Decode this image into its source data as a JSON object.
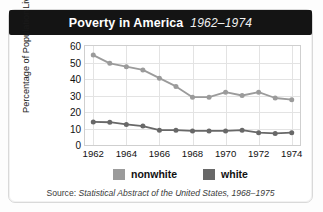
{
  "title": {
    "main": "Poverty in America",
    "years": "1962–1974"
  },
  "axes": {
    "ylabel_line1": "Percentage of Population",
    "ylabel_line2": "Living Below Poverty Level",
    "yticks": [
      "0",
      "10",
      "20",
      "30",
      "40",
      "50",
      "60"
    ],
    "xticks": [
      "1962",
      "1964",
      "1966",
      "1968",
      "1970",
      "1972",
      "1974"
    ]
  },
  "legend": {
    "items": [
      {
        "label": "nonwhite",
        "color": "#9b9b9b"
      },
      {
        "label": "white",
        "color": "#686868"
      }
    ]
  },
  "source": {
    "lead": "Source:",
    "cite": "Statistical Abstract of the United States, 1968–1975"
  },
  "colors": {
    "title_bar": "#141414",
    "title_text": "#ffffff",
    "grid": "#e3e3e3",
    "plot_border": "#cfcfcf",
    "nonwhite": "#9b9b9b",
    "white": "#686868"
  },
  "chart_data": {
    "type": "line",
    "title": "Poverty in America 1962–1974",
    "xlabel": "",
    "ylabel": "Percentage of Population Living Below Poverty Level",
    "x": [
      1962,
      1963,
      1964,
      1965,
      1966,
      1967,
      1968,
      1969,
      1970,
      1971,
      1972,
      1973,
      1974
    ],
    "xlim": [
      1961.5,
      1974.5
    ],
    "ylim": [
      0,
      60
    ],
    "yticks": [
      0,
      10,
      20,
      30,
      40,
      50,
      60
    ],
    "xticks": [
      1962,
      1964,
      1966,
      1968,
      1970,
      1972,
      1974
    ],
    "grid": true,
    "legend_position": "below",
    "series": [
      {
        "name": "nonwhite",
        "color": "#9b9b9b",
        "values": [
          54.5,
          49.5,
          47.5,
          45.5,
          40.5,
          35.5,
          29.0,
          29.0,
          32.0,
          30.0,
          32.0,
          28.5,
          27.5
        ]
      },
      {
        "name": "white",
        "color": "#686868",
        "values": [
          14.0,
          13.8,
          12.5,
          11.5,
          9.0,
          9.0,
          8.5,
          8.5,
          8.5,
          9.0,
          7.5,
          7.0,
          7.5
        ]
      }
    ],
    "source": "Source: Statistical Abstract of the United States, 1968–1975"
  }
}
